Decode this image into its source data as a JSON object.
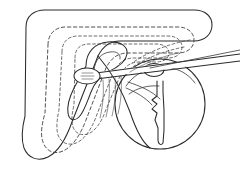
{
  "figure": {
    "title": "Anatomical line drawing",
    "background_color": "#ffffff",
    "line_color": "#2b2b2b",
    "dashed_line_color": "#3d3d3d",
    "width": 240,
    "height": 181,
    "parts": [
      {
        "id": "outer-organ-outline",
        "label": "Outer organ outline",
        "style": "solid",
        "notes": "Large rounded triangular / boomerang shaped body occupying the left two thirds of the frame"
      },
      {
        "id": "contour-layer-1",
        "label": "First inner contour",
        "style": "dashed",
        "notes": "Dashed contour set inside the outer outline"
      },
      {
        "id": "contour-layer-2",
        "label": "Second inner contour",
        "style": "dashed",
        "notes": "Second nested dashed contour"
      },
      {
        "id": "contour-layer-3",
        "label": "Third inner contour",
        "style": "dashed",
        "notes": "Innermost dashed contour running close to the central cavity"
      },
      {
        "id": "central-cavity",
        "label": "Central cavity outline",
        "style": "solid",
        "notes": "Solid teardrop cavity in the middle of the organ"
      },
      {
        "id": "circular-structure",
        "label": "Circular structure",
        "style": "solid",
        "notes": "Large circle on the right side overlapping the organ body"
      },
      {
        "id": "zigzag-band",
        "label": "Zigzag internal band",
        "style": "solid",
        "notes": "Narrow vertical band with irregular zigzag left edge hanging inside the circle"
      },
      {
        "id": "instrument-shaft",
        "label": "Instrument shaft",
        "style": "solid",
        "notes": "Two long thin parallel lines entering from the right edge"
      },
      {
        "id": "instrument-tip-loop",
        "label": "Instrument tip loop",
        "style": "solid",
        "notes": "Oval spoon shaped tip with internal hatch marks at the left end of the shaft"
      },
      {
        "id": "small-ring",
        "label": "Small ring",
        "style": "solid",
        "notes": "Small loop where the shaft meets the circular structure"
      },
      {
        "id": "hatch-band",
        "label": "Hatched band",
        "style": "solid",
        "notes": "Short parallel hatch strokes descending from the instrument tip area"
      }
    ]
  }
}
